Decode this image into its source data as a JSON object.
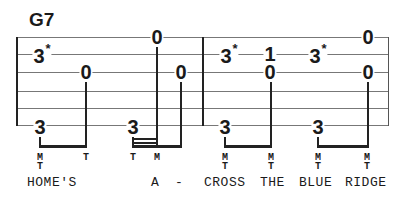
{
  "chord": "G7",
  "staff": {
    "line_y": [
      37,
      54,
      72,
      91,
      108,
      125
    ],
    "left": 17,
    "right": 388,
    "measure_bar_x": 202
  },
  "notes": [
    {
      "fret": "3",
      "mark": "*",
      "x": 42,
      "y": 54
    },
    {
      "fret": "0",
      "mark": "",
      "x": 86,
      "y": 72
    },
    {
      "fret": "0",
      "mark": "",
      "x": 157,
      "y": 37
    },
    {
      "fret": "0",
      "mark": "",
      "x": 181,
      "y": 72
    },
    {
      "fret": "3",
      "mark": "",
      "x": 40,
      "y": 127
    },
    {
      "fret": "3",
      "mark": "",
      "x": 133,
      "y": 127
    },
    {
      "fret": "3",
      "mark": "*",
      "x": 229,
      "y": 54
    },
    {
      "fret": "1",
      "mark": "",
      "x": 270,
      "y": 54
    },
    {
      "fret": "0",
      "mark": "",
      "x": 270,
      "y": 72
    },
    {
      "fret": "3",
      "mark": "*",
      "x": 318,
      "y": 54
    },
    {
      "fret": "0",
      "mark": "",
      "x": 368,
      "y": 37
    },
    {
      "fret": "0",
      "mark": "",
      "x": 368,
      "y": 72
    },
    {
      "fret": "3",
      "mark": "",
      "x": 225,
      "y": 127
    },
    {
      "fret": "3",
      "mark": "",
      "x": 318,
      "y": 127
    }
  ],
  "fingerings": [
    {
      "top": "M",
      "bottom": "T",
      "x": 40
    },
    {
      "top": "T",
      "bottom": "",
      "x": 86
    },
    {
      "top": "T",
      "bottom": "",
      "x": 133
    },
    {
      "top": "M",
      "bottom": "",
      "x": 157
    },
    {
      "top": "M",
      "bottom": "T",
      "x": 225
    },
    {
      "top": "M",
      "bottom": "T",
      "x": 271
    },
    {
      "top": "M",
      "bottom": "T",
      "x": 318
    },
    {
      "top": "M",
      "bottom": "T",
      "x": 367
    }
  ],
  "lyrics": [
    {
      "text": "HOME'S",
      "x": 27
    },
    {
      "text": "A",
      "x": 151
    },
    {
      "text": "-",
      "x": 175
    },
    {
      "text": "CROSS",
      "x": 204
    },
    {
      "text": "THE",
      "x": 260
    },
    {
      "text": "BLUE",
      "x": 299
    },
    {
      "text": "RIDGE",
      "x": 345
    }
  ]
}
